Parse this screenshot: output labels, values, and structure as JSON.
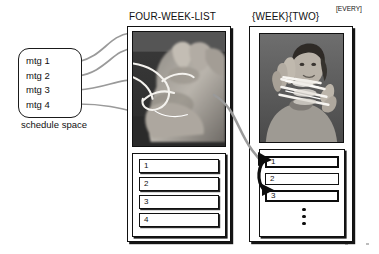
{
  "figure": {
    "schedule": {
      "caption": "schedule space",
      "items": [
        {
          "label": "mtg 1"
        },
        {
          "label": "mtg 2"
        },
        {
          "label": "mtg 3"
        },
        {
          "label": "mtg 4"
        }
      ]
    },
    "panels": [
      {
        "id": "four-week-list",
        "title": "FOUR-WEEK-LIST",
        "title_superscript": "",
        "photo_alt": "hand-with-string-photo",
        "rows": [
          {
            "label": "1",
            "emphasis": "normal"
          },
          {
            "label": "2",
            "emphasis": "normal"
          },
          {
            "label": "3",
            "emphasis": "normal"
          },
          {
            "label": "4",
            "emphasis": "normal"
          }
        ],
        "ellipsis": false
      },
      {
        "id": "week-two-every",
        "title": "{WEEK}{TWO}",
        "title_superscript": "[EVERY]",
        "photo_alt": "person-holding-string-photo",
        "rows": [
          {
            "label": "1",
            "emphasis": "thick"
          },
          {
            "label": "2",
            "emphasis": "thin"
          },
          {
            "label": "3",
            "emphasis": "thick"
          }
        ],
        "ellipsis": true
      }
    ],
    "colors": {
      "arrow_gray": "#9a9a9a",
      "arrow_black": "#0d0d0d",
      "ink": "#111111",
      "paper": "#ffffff",
      "photo_dark": "#3d3d3d",
      "photo_light": "#e8e6e2"
    }
  }
}
